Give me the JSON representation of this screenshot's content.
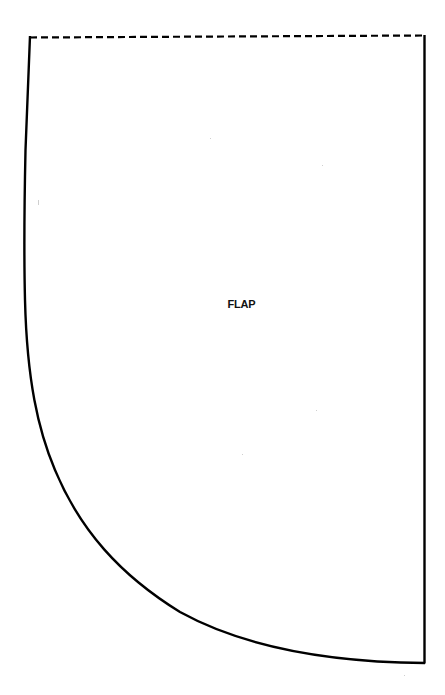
{
  "pattern": {
    "piece_label": "FLAP",
    "colors": {
      "line": "#000000",
      "label": "#111111",
      "background": "#ffffff"
    },
    "edges": {
      "top": "fold-line (dashed)",
      "right": "straight",
      "left_bottom": "curved"
    }
  }
}
